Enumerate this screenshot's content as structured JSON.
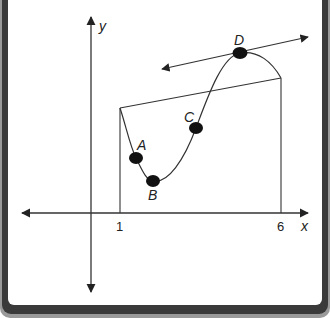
{
  "diagram": {
    "axes": {
      "x_label": "x",
      "y_label": "y",
      "ticks": [
        {
          "label": "1",
          "x": 120
        },
        {
          "label": "6",
          "x": 281
        }
      ]
    },
    "points": [
      {
        "label": "A",
        "cx": 136,
        "cy": 158
      },
      {
        "label": "B",
        "cx": 153,
        "cy": 181
      },
      {
        "label": "C",
        "cx": 196,
        "cy": 128
      },
      {
        "label": "D",
        "cx": 240,
        "cy": 53
      }
    ],
    "lines": {
      "secant": "secant line from (1, f(1)) to (6, f(6))",
      "tangent": "tangent line at D"
    },
    "colors": {
      "ink": "#222222",
      "frame": "#3a3a3a",
      "background": "#ffffff"
    }
  }
}
